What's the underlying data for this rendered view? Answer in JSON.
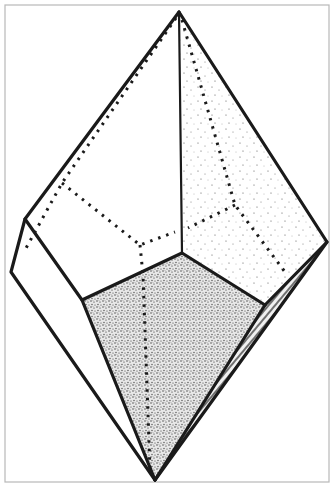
{
  "figure": {
    "type": "crystal-habit-diagram",
    "colors": {
      "background": "#ffffff",
      "edge": "#1a1a1a",
      "frame": "#b8b8b8"
    },
    "vertices": {
      "apex_top": [
        179,
        12
      ],
      "left_upper": [
        25,
        219
      ],
      "left_lower": [
        11,
        272
      ],
      "center": [
        182,
        253
      ],
      "inner_left": [
        82,
        300
      ],
      "inner_right": [
        265,
        305
      ],
      "right": [
        327,
        242
      ],
      "apex_bottom": [
        155,
        480
      ],
      "right_lower": [
        315,
        305
      ]
    },
    "faces": [
      {
        "name": "upper-left-face",
        "shading": "none"
      },
      {
        "name": "upper-right-face",
        "shading": "light-stipple"
      },
      {
        "name": "left-prism-face",
        "shading": "none"
      },
      {
        "name": "front-lower-face",
        "shading": "dense-stipple"
      },
      {
        "name": "right-lower-face",
        "shading": "hatched"
      }
    ],
    "hidden_edges_style": "dotted"
  }
}
